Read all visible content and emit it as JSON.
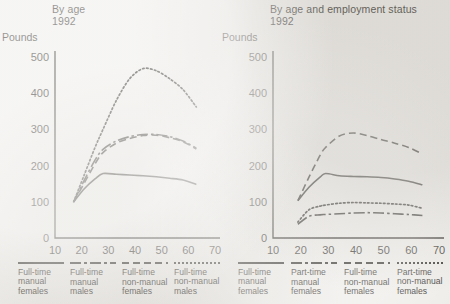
{
  "chart_data": [
    {
      "type": "line",
      "title": "By age",
      "subtitle": "1992",
      "ylabel": "Pounds",
      "xlabel": "",
      "xlim": [
        10,
        70
      ],
      "ylim": [
        0,
        500
      ],
      "xticks": [
        10,
        20,
        30,
        40,
        50,
        60,
        70
      ],
      "yticks": [
        0,
        100,
        200,
        300,
        400,
        500
      ],
      "grid": false,
      "legend_position": "below",
      "series": [
        {
          "name": "Full-time manual females",
          "name_lines": [
            "Full-time",
            "manual",
            "females"
          ],
          "style": "solid",
          "x": [
            17,
            21,
            25,
            28,
            33,
            38,
            43,
            48,
            53,
            58,
            63
          ],
          "values": [
            100,
            136,
            163,
            178,
            176,
            174,
            172,
            169,
            165,
            160,
            148
          ]
        },
        {
          "name": "Full-time manual males",
          "name_lines": [
            "Full-time",
            "manual",
            "males"
          ],
          "style": "dash-dot",
          "x": [
            17,
            21,
            25,
            28,
            33,
            38,
            43,
            48,
            53,
            58,
            63
          ],
          "values": [
            100,
            160,
            215,
            245,
            268,
            280,
            286,
            286,
            280,
            268,
            248
          ]
        },
        {
          "name": "Full-time non-manual females",
          "name_lines": [
            "Full-time",
            "non-manual",
            "females"
          ],
          "style": "dashed",
          "x": [
            17,
            21,
            25,
            28,
            33,
            38,
            43,
            48,
            53,
            58,
            63
          ],
          "values": [
            100,
            152,
            205,
            236,
            262,
            275,
            283,
            284,
            277,
            266,
            246
          ]
        },
        {
          "name": "Full-time non-manual males",
          "name_lines": [
            "Full-time",
            "non-manual",
            "males"
          ],
          "style": "dotted",
          "x": [
            17,
            21,
            25,
            28,
            33,
            38,
            43,
            48,
            53,
            58,
            63
          ],
          "values": [
            100,
            175,
            250,
            300,
            380,
            440,
            468,
            462,
            440,
            410,
            362
          ]
        }
      ]
    },
    {
      "type": "line",
      "title": "By age and employment status",
      "subtitle": "1992",
      "ylabel": "Pounds",
      "xlabel": "",
      "xlim": [
        10,
        70
      ],
      "ylim": [
        0,
        500
      ],
      "xticks": [
        10,
        20,
        30,
        40,
        50,
        60,
        70
      ],
      "yticks": [
        0,
        100,
        200,
        300,
        400,
        500
      ],
      "grid": false,
      "legend_position": "below",
      "series": [
        {
          "name": "Full-time manual females",
          "name_lines": [
            "Full-time",
            "manual",
            "females"
          ],
          "style": "solid",
          "x": [
            19,
            23,
            27,
            29,
            34,
            39,
            44,
            49,
            54,
            59,
            64
          ],
          "values": [
            103,
            140,
            168,
            178,
            172,
            170,
            169,
            167,
            163,
            157,
            147
          ]
        },
        {
          "name": "Part-time manual females",
          "name_lines": [
            "Part-time",
            "manual",
            "females"
          ],
          "style": "dash-dot",
          "x": [
            19,
            23,
            27,
            29,
            34,
            39,
            44,
            49,
            54,
            59,
            64
          ],
          "values": [
            38,
            60,
            64,
            65,
            67,
            69,
            70,
            69,
            67,
            65,
            62
          ]
        },
        {
          "name": "Full-time non-manual females",
          "name_lines": [
            "Full-time",
            "non-manual",
            "females"
          ],
          "style": "dashed",
          "x": [
            19,
            23,
            27,
            29,
            34,
            39,
            44,
            49,
            54,
            59,
            64
          ],
          "values": [
            103,
            168,
            228,
            250,
            282,
            290,
            283,
            272,
            262,
            250,
            232
          ]
        },
        {
          "name": "Part-time non-manual females",
          "name_lines": [
            "Part-time",
            "non-manual",
            "females"
          ],
          "style": "dotted",
          "x": [
            19,
            23,
            27,
            29,
            34,
            39,
            44,
            49,
            54,
            59,
            64
          ],
          "values": [
            44,
            78,
            88,
            91,
            96,
            98,
            97,
            96,
            94,
            91,
            82
          ]
        }
      ]
    }
  ],
  "colors": {
    "ink": "#17150f",
    "background": "#eceae6"
  }
}
